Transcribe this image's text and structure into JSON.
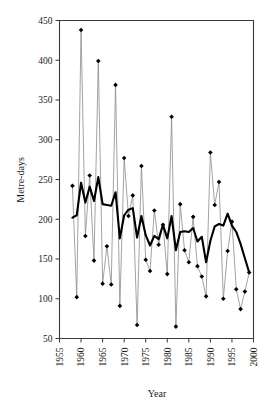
{
  "chart_data": {
    "type": "line",
    "title": "",
    "subtitle": "",
    "xlabel": "Year",
    "ylabel": "Metre-days",
    "xlim": [
      1955,
      2000
    ],
    "ylim": [
      50,
      450
    ],
    "xticks": [
      1955,
      1960,
      1965,
      1970,
      1975,
      1980,
      1985,
      1990,
      1995,
      2000
    ],
    "yticks": [
      50,
      100,
      150,
      200,
      250,
      300,
      350,
      400,
      450
    ],
    "xtick_labels": [
      "1955",
      "1960",
      "1965",
      "1970",
      "1975",
      "1980",
      "1985",
      "1990",
      "1995",
      "2000"
    ],
    "ytick_labels": [
      "50",
      "100",
      "150",
      "200",
      "250",
      "300",
      "350",
      "400",
      "450"
    ],
    "xtick_rotation": 90,
    "grid": false,
    "legend": "none",
    "annotations": [],
    "x": [
      1958,
      1959,
      1960,
      1961,
      1962,
      1963,
      1964,
      1965,
      1966,
      1967,
      1968,
      1969,
      1970,
      1971,
      1972,
      1973,
      1974,
      1975,
      1976,
      1977,
      1978,
      1979,
      1980,
      1981,
      1982,
      1983,
      1984,
      1985,
      1986,
      1987,
      1988,
      1989,
      1990,
      1991,
      1992,
      1993,
      1994,
      1995,
      1996,
      1997,
      1998,
      1999
    ],
    "series": [
      {
        "name": "Annual value",
        "style": "thin-line-with-diamond-markers",
        "color": "#8c8c8c",
        "marker_color": "#000000",
        "values": [
          242,
          102,
          438,
          179,
          255,
          148,
          399,
          119,
          166,
          118,
          369,
          91,
          277,
          204,
          230,
          67,
          267,
          149,
          135,
          211,
          168,
          193,
          131,
          329,
          65,
          219,
          161,
          146,
          203,
          141,
          128,
          103,
          284,
          218,
          247,
          100,
          160,
          197,
          112,
          87,
          109,
          133
        ]
      },
      {
        "name": "Smoothed trend",
        "style": "thick-line",
        "color": "#000000",
        "values": [
          202,
          205,
          246,
          221,
          241,
          223,
          253,
          219,
          218,
          217,
          234,
          176,
          205,
          212,
          214,
          177,
          204,
          180,
          167,
          179,
          175,
          193,
          176,
          204,
          161,
          184,
          185,
          184,
          189,
          172,
          178,
          146,
          173,
          191,
          194,
          192,
          207,
          192,
          184,
          169,
          151,
          133
        ]
      }
    ]
  }
}
